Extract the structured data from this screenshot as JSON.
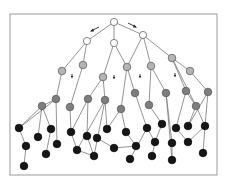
{
  "diagram": {
    "title": "",
    "type": "layered-tree-graph",
    "colors": {
      "border": "#9a9a9a",
      "edge": "#7a7a7a",
      "level_0": "#ffffff",
      "level_1": "#ffffff",
      "level_2": "#b4b4b4",
      "level_3": "#7e7e7e",
      "level_4": "#161616",
      "node_stroke": "#555555",
      "arrow": "#222222"
    },
    "nodes": [
      {
        "id": "r",
        "level": 0
      },
      {
        "id": "w1",
        "level": 1
      },
      {
        "id": "w2",
        "level": 1
      },
      {
        "id": "w3",
        "level": 1
      },
      {
        "id": "g1",
        "level": 2
      },
      {
        "id": "g2",
        "level": 2
      },
      {
        "id": "g3",
        "level": 2
      },
      {
        "id": "g4",
        "level": 2
      },
      {
        "id": "g5",
        "level": 2
      },
      {
        "id": "g6",
        "level": 2
      },
      {
        "id": "g7",
        "level": 2
      },
      {
        "id": "d1",
        "level": 3
      },
      {
        "id": "d2",
        "level": 3
      },
      {
        "id": "d3",
        "level": 3
      },
      {
        "id": "d4",
        "level": 3
      },
      {
        "id": "d5",
        "level": 3
      },
      {
        "id": "d6",
        "level": 3
      },
      {
        "id": "d7",
        "level": 3
      },
      {
        "id": "d8",
        "level": 3
      },
      {
        "id": "d9",
        "level": 3
      },
      {
        "id": "d10",
        "level": 3
      },
      {
        "id": "d11",
        "level": 3
      },
      {
        "id": "d12",
        "level": 3
      },
      {
        "id": "b1",
        "level": 4
      },
      {
        "id": "b2",
        "level": 4
      },
      {
        "id": "b3",
        "level": 4
      },
      {
        "id": "b4",
        "level": 4
      },
      {
        "id": "b5",
        "level": 4
      },
      {
        "id": "b6",
        "level": 4
      },
      {
        "id": "b7",
        "level": 4
      },
      {
        "id": "b8",
        "level": 4
      },
      {
        "id": "b9",
        "level": 4
      },
      {
        "id": "b10",
        "level": 4
      },
      {
        "id": "b11",
        "level": 4
      },
      {
        "id": "b12",
        "level": 4
      },
      {
        "id": "b13",
        "level": 4
      },
      {
        "id": "b14",
        "level": 4
      },
      {
        "id": "b15",
        "level": 4
      },
      {
        "id": "b16",
        "level": 4
      },
      {
        "id": "b17",
        "level": 4
      },
      {
        "id": "b18",
        "level": 4
      },
      {
        "id": "b19",
        "level": 4
      },
      {
        "id": "b20",
        "level": 4
      },
      {
        "id": "b21",
        "level": 4
      },
      {
        "id": "b22",
        "level": 4
      },
      {
        "id": "b23",
        "level": 4
      },
      {
        "id": "b24",
        "level": 4
      },
      {
        "id": "b25",
        "level": 4
      },
      {
        "id": "b26",
        "level": 4
      },
      {
        "id": "b27",
        "level": 4
      },
      {
        "id": "b28",
        "level": 4
      }
    ],
    "edges": [
      [
        "r",
        "w1"
      ],
      [
        "r",
        "w2"
      ],
      [
        "r",
        "w3"
      ],
      [
        "w1",
        "g1"
      ],
      [
        "w1",
        "g2"
      ],
      [
        "w2",
        "g3"
      ],
      [
        "w2",
        "g4"
      ],
      [
        "w3",
        "g4"
      ],
      [
        "w3",
        "g5"
      ],
      [
        "w3",
        "g6"
      ],
      [
        "g1",
        "d2"
      ],
      [
        "g2",
        "d3"
      ],
      [
        "g3",
        "d4"
      ],
      [
        "g3",
        "d5"
      ],
      [
        "g4",
        "d6"
      ],
      [
        "g4",
        "d7"
      ],
      [
        "g5",
        "d8"
      ],
      [
        "g5",
        "d9"
      ],
      [
        "g6",
        "d10"
      ],
      [
        "g6",
        "d11"
      ],
      [
        "g6",
        "g7"
      ],
      [
        "g7",
        "d12"
      ],
      [
        "d1",
        "b1"
      ],
      [
        "d1",
        "b4"
      ],
      [
        "d1",
        "b5"
      ],
      [
        "d2",
        "d1"
      ],
      [
        "d2",
        "b7"
      ],
      [
        "d2",
        "b1"
      ],
      [
        "d3",
        "b8"
      ],
      [
        "d4",
        "b8"
      ],
      [
        "d4",
        "b10"
      ],
      [
        "d5",
        "b9"
      ],
      [
        "d5",
        "b11"
      ],
      [
        "d5",
        "b13"
      ],
      [
        "d6",
        "b15"
      ],
      [
        "d6",
        "b13"
      ],
      [
        "d7",
        "b18"
      ],
      [
        "d8",
        "b20"
      ],
      [
        "d9",
        "b22"
      ],
      [
        "d9",
        "b23"
      ],
      [
        "d10",
        "b24"
      ],
      [
        "d10",
        "d11"
      ],
      [
        "d11",
        "b25"
      ],
      [
        "d11",
        "b27"
      ],
      [
        "d12",
        "b27"
      ],
      [
        "d12",
        "b25"
      ],
      [
        "b1",
        "b2"
      ],
      [
        "b2",
        "b3"
      ],
      [
        "b5",
        "b6"
      ],
      [
        "b8",
        "b9"
      ],
      [
        "b9",
        "b11"
      ],
      [
        "b10",
        "b11"
      ],
      [
        "b12",
        "b14"
      ],
      [
        "b14",
        "b17"
      ],
      [
        "b15",
        "b17"
      ],
      [
        "b16",
        "b18"
      ],
      [
        "b18",
        "b19"
      ],
      [
        "b19",
        "b21"
      ],
      [
        "b20",
        "b19"
      ],
      [
        "b22",
        "b23"
      ],
      [
        "b24",
        "b26"
      ],
      [
        "b27",
        "b26"
      ],
      [
        "b27",
        "b28"
      ]
    ],
    "arrows": [
      {
        "id": "arrow-left-top",
        "direction": "down-left"
      },
      {
        "id": "arrow-right-top",
        "direction": "down-right"
      },
      {
        "id": "arrow-small-1",
        "direction": "down"
      },
      {
        "id": "arrow-small-2",
        "direction": "down"
      },
      {
        "id": "arrow-small-3",
        "direction": "down"
      },
      {
        "id": "arrow-small-4",
        "direction": "down"
      }
    ]
  }
}
